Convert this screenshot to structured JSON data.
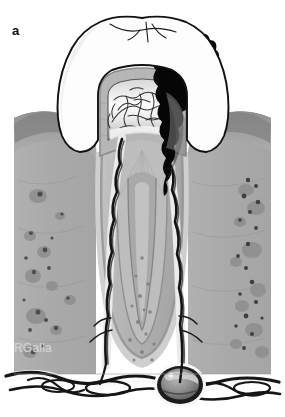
{
  "figure": {
    "panel_label": "a",
    "artist_credit": "RGalla",
    "background_color": "#ffffff",
    "width": 285,
    "height": 417
  },
  "palette": {
    "background": "#ffffff",
    "enamel": "#fdfdfd",
    "enamel_outline": "#1a1a1a",
    "dentin_outer": "#b9b9b9",
    "dentin_mid": "#a8a8a8",
    "dentin_inner": "#cfcfcf",
    "pulp_chamber": "#e8e8e8",
    "pulp_highlight": "#f6f6f6",
    "caries_lesion": "#060606",
    "gingiva": "#9a9a9a",
    "gingiva_dark": "#8a8a8a",
    "alveolar_bone": "#b4b4b4",
    "bone_marrow": "#a0a0a0",
    "bone_speckle": "#7d7d7d",
    "pdl_space": "#c6c6c6",
    "cementum": "#9e9e9e",
    "periapical_lesion": "#8e8e8e",
    "nerve_vessel": "#171717",
    "canal_white": "#fafafa",
    "credit_text": "#d2d2d2"
  },
  "anatomy": {
    "structures": [
      {
        "id": "crown-enamel",
        "label": "Enamel crown",
        "note": "white cusped crown outlined in black"
      },
      {
        "id": "carious-lesion",
        "label": "Carious lesion",
        "note": "solid black decay tract from distal cusp into pulp"
      },
      {
        "id": "dentin",
        "label": "Dentin",
        "note": "mid-grey banded layer with tubule striations"
      },
      {
        "id": "pulp-chamber",
        "label": "Pulp chamber",
        "note": "light chamber with inflamed vascular plexus"
      },
      {
        "id": "pulp-vasculature",
        "label": "Inflamed pulp vessels",
        "note": "fine dark branching network in coronal pulp"
      },
      {
        "id": "root-canal-mesial",
        "label": "Mesial root canal",
        "note": "white canal with dark neurovascular bundle"
      },
      {
        "id": "root-canal-distal",
        "label": "Distal root canal",
        "note": "white canal with dark neurovascular bundle"
      },
      {
        "id": "gingiva",
        "label": "Gingiva",
        "note": "darker grey soft tissue collar both sides"
      },
      {
        "id": "alveolar-bone",
        "label": "Alveolar bone",
        "note": "speckled grey trabecular bone flanking roots"
      },
      {
        "id": "periodontal-ligament",
        "label": "Periodontal ligament",
        "note": "thin lighter band around root surfaces"
      },
      {
        "id": "periapical-lesion",
        "label": "Periapical lesion",
        "note": "dark ovoid granuloma at distal root apex"
      },
      {
        "id": "apical-nerve-plexus",
        "label": "Apical neurovascular plexus",
        "note": "black vessels/nerves running along base"
      }
    ]
  }
}
